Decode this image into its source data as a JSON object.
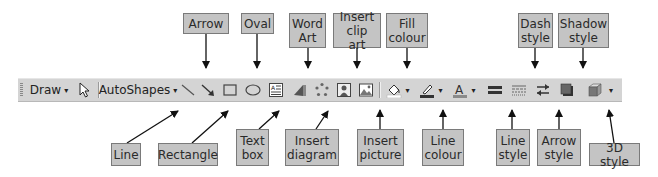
{
  "toolbar": {
    "draw_label": "Draw",
    "draw_dropdown": "▾",
    "autoshapes_label": "AutoShapes",
    "autoshapes_dropdown": "▾",
    "more_dropdown": "▾",
    "background_color": "#d4d4d4",
    "items": [
      {
        "name": "select-objects-icon"
      },
      {
        "name": "line-icon"
      },
      {
        "name": "arrow-icon"
      },
      {
        "name": "rectangle-icon"
      },
      {
        "name": "oval-icon"
      },
      {
        "name": "text-box-icon"
      },
      {
        "name": "word-art-icon"
      },
      {
        "name": "insert-diagram-icon"
      },
      {
        "name": "insert-clip-art-icon"
      },
      {
        "name": "insert-picture-icon"
      },
      {
        "name": "fill-colour-icon"
      },
      {
        "name": "line-colour-icon"
      },
      {
        "name": "font-colour-icon"
      },
      {
        "name": "line-style-icon"
      },
      {
        "name": "dash-style-icon"
      },
      {
        "name": "arrow-style-icon"
      },
      {
        "name": "shadow-style-icon"
      },
      {
        "name": "3d-style-icon"
      }
    ]
  },
  "callouts_top": [
    {
      "id": "arrow",
      "text": "Arrow"
    },
    {
      "id": "oval",
      "text": "Oval"
    },
    {
      "id": "word-art",
      "text": "Word\nArt"
    },
    {
      "id": "insert-clip-art",
      "text": "Insert\nclip art"
    },
    {
      "id": "fill-colour",
      "text": "Fill\ncolour"
    },
    {
      "id": "dash-style",
      "text": "Dash\nstyle"
    },
    {
      "id": "shadow-style",
      "text": "Shadow\nstyle"
    }
  ],
  "callouts_bottom": [
    {
      "id": "line",
      "text": "Line"
    },
    {
      "id": "rectangle",
      "text": "Rectangle"
    },
    {
      "id": "text-box",
      "text": "Text\nbox"
    },
    {
      "id": "insert-diagram",
      "text": "Insert\ndiagram"
    },
    {
      "id": "insert-picture",
      "text": "Insert\npicture"
    },
    {
      "id": "line-colour",
      "text": "Line\ncolour"
    },
    {
      "id": "line-style",
      "text": "Line\nstyle"
    },
    {
      "id": "arrow-style",
      "text": "Arrow\nstyle"
    },
    {
      "id": "3d-style",
      "text": "3D style"
    }
  ],
  "colors": {
    "label_fill": "#c4c4c4",
    "label_border": "#7a7a7a",
    "toolbar": "#d4d4d4"
  }
}
